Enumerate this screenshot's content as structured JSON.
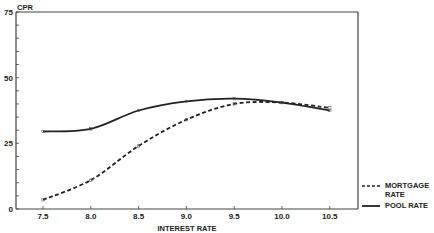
{
  "chart_data": {
    "type": "line",
    "title": "",
    "xlabel": "INTEREST RATE",
    "ylabel": "CPR",
    "xlim": [
      7.5,
      10.5
    ],
    "ylim": [
      0,
      75
    ],
    "x_ticks": [
      "7.5",
      "8.0",
      "8.5",
      "9.0",
      "9.5",
      "10.0",
      "10.5"
    ],
    "y_ticks": [
      "0",
      "25",
      "50",
      "75"
    ],
    "y_minor_tick_step": 5,
    "grid": false,
    "legend_position": "right-bottom",
    "x": [
      7.5,
      8.0,
      8.5,
      9.0,
      9.5,
      10.0,
      10.5
    ],
    "series": [
      {
        "name": "MORTGAGE RATE",
        "style": "dashed",
        "values": [
          3.5,
          11,
          24,
          34,
          40,
          40.5,
          38.5
        ]
      },
      {
        "name": "POOL RATE",
        "style": "solid",
        "values": [
          29.5,
          30.5,
          37.5,
          41,
          42,
          40.5,
          37.5
        ]
      }
    ],
    "legend": [
      {
        "label_line1": "MORTGAGE",
        "label_line2": "RATE",
        "style": "dashed"
      },
      {
        "label_line1": "POOL RATE",
        "style": "solid"
      }
    ],
    "colors": {
      "line": "#222222",
      "frame": "#444444",
      "background": "#ffffff"
    }
  }
}
